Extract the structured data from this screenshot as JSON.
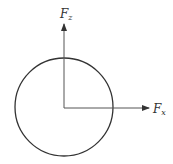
{
  "diagram": {
    "type": "force-vector-diagram",
    "circle": {
      "cx": 64,
      "cy": 107,
      "r": 49,
      "stroke": "#333333"
    },
    "origin": {
      "x": 64,
      "y": 108
    },
    "vectors": [
      {
        "name": "Fz",
        "label_main": "F",
        "label_sub": "z",
        "x2": 64,
        "y2": 24,
        "label_x": 60,
        "label_y": 18
      },
      {
        "name": "Fx",
        "label_main": "F",
        "label_sub": "x",
        "x2": 149,
        "y2": 108,
        "label_x": 153,
        "label_y": 113
      }
    ],
    "line_color": "#444444"
  }
}
